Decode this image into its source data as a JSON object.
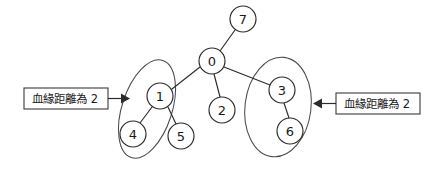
{
  "diagram": {
    "background_color": "#ffffff",
    "stroke_color": "#2b2b2b",
    "nodes": [
      {
        "id": "7",
        "label": "7",
        "cx": 243,
        "cy": 19,
        "r": 13
      },
      {
        "id": "0",
        "label": "0",
        "cx": 212,
        "cy": 61,
        "r": 13
      },
      {
        "id": "1",
        "label": "1",
        "cx": 160,
        "cy": 96,
        "r": 13
      },
      {
        "id": "2",
        "label": "2",
        "cx": 222,
        "cy": 110,
        "r": 13
      },
      {
        "id": "3",
        "label": "3",
        "cx": 282,
        "cy": 90,
        "r": 13
      },
      {
        "id": "4",
        "label": "4",
        "cx": 133,
        "cy": 134,
        "r": 13
      },
      {
        "id": "5",
        "label": "5",
        "cx": 181,
        "cy": 136,
        "r": 13
      },
      {
        "id": "6",
        "label": "6",
        "cx": 290,
        "cy": 131,
        "r": 13
      }
    ],
    "edges": [
      {
        "from": "0",
        "to": "7",
        "name": "edge-0-7"
      },
      {
        "from": "0",
        "to": "1",
        "name": "edge-0-1"
      },
      {
        "from": "0",
        "to": "2",
        "name": "edge-0-2"
      },
      {
        "from": "0",
        "to": "3",
        "name": "edge-0-3"
      },
      {
        "from": "1",
        "to": "4",
        "name": "edge-1-4"
      },
      {
        "from": "1",
        "to": "5",
        "name": "edge-1-5"
      },
      {
        "from": "3",
        "to": "6",
        "name": "edge-3-6"
      }
    ],
    "groups": [
      {
        "name": "group-ellipse-left",
        "members": [
          "1",
          "4"
        ],
        "cx": 147,
        "cy": 109,
        "rx": 25,
        "ry": 51,
        "rotation": 18
      },
      {
        "name": "group-ellipse-right",
        "members": [
          "3",
          "6"
        ],
        "cx": 278,
        "cy": 107,
        "rx": 33,
        "ry": 50,
        "rotation": 7
      }
    ],
    "callouts": [
      {
        "name": "callout-left",
        "text": "血緣距離為 2",
        "box": {
          "x": 24,
          "y": 88,
          "w": 84,
          "h": 21
        },
        "pointer": {
          "x1": 108,
          "y1": 98,
          "x2": 124,
          "y2": 98
        },
        "arrow_direction": "right"
      },
      {
        "name": "callout-right",
        "text": "血緣距離為 2",
        "box": {
          "x": 336,
          "y": 93,
          "w": 84,
          "h": 21
        },
        "pointer": {
          "x1": 336,
          "y1": 103,
          "x2": 313,
          "y2": 103
        },
        "arrow_direction": "left"
      }
    ]
  }
}
